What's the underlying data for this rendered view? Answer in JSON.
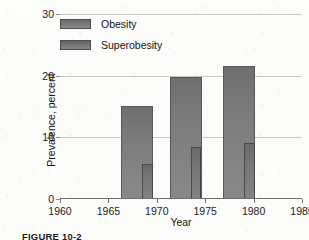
{
  "figure": {
    "caption": "FIGURE 10-2"
  },
  "legend": {
    "position": "inside-top-left",
    "items": [
      {
        "label": "Obesity",
        "swatch": "obesity-swatch",
        "color": "#7b7b7b"
      },
      {
        "label": "Superobesity",
        "swatch": "superobesity-swatch",
        "color": "#757575"
      }
    ]
  },
  "chart_data": {
    "type": "bar",
    "title": "",
    "subtitle": "",
    "xlabel": "Year",
    "ylabel": "Prevalence, percent",
    "x": [
      1968,
      1973,
      1978.5
    ],
    "categories": [
      "1968",
      "1973",
      "1978.5"
    ],
    "series": [
      {
        "name": "Obesity",
        "values": [
          15.0,
          19.7,
          21.4
        ],
        "color": "#7b7b7b"
      },
      {
        "name": "Superobesity",
        "values": [
          5.5,
          8.2,
          9.0
        ],
        "color": "#757575"
      }
    ],
    "xlim": [
      1960,
      1985
    ],
    "ylim": [
      0,
      30
    ],
    "xticks": [
      1960,
      1965,
      1970,
      1975,
      1980,
      1985
    ],
    "xtick_labels": [
      "1960",
      "1965",
      "1970",
      "1975",
      "1980",
      "1985"
    ],
    "yticks": [
      0,
      10,
      20,
      30
    ],
    "ytick_labels": [
      "0",
      "10",
      "20",
      "30"
    ],
    "grid": "horizontal",
    "legend_position": "inside-top-left",
    "bar_width_years": 3.3,
    "overlay_bar_width_years": 1.1,
    "overlay_offset_years": 1.05
  }
}
